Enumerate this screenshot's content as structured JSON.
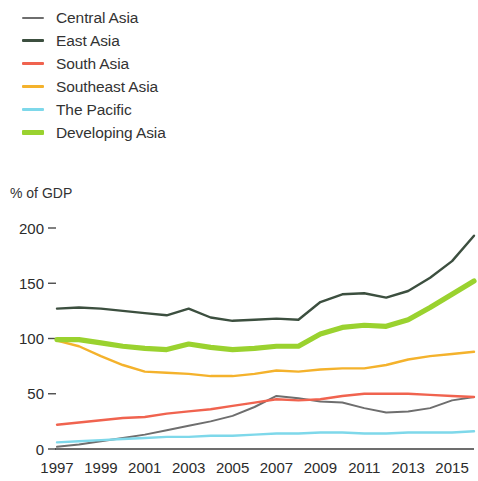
{
  "legend": {
    "items": [
      {
        "label": "Central Asia",
        "color": "#6e6e6e",
        "width": 2.0
      },
      {
        "label": "East Asia",
        "color": "#3c4f3f",
        "width": 2.4
      },
      {
        "label": "South Asia",
        "color": "#f0634f",
        "width": 2.4
      },
      {
        "label": "Southeast Asia",
        "color": "#f4b22c",
        "width": 2.4
      },
      {
        "label": "The Pacific",
        "color": "#7ed8ea",
        "width": 2.4
      },
      {
        "label": "Developing Asia",
        "color": "#9ad22f",
        "width": 5.2
      }
    ]
  },
  "axis_title": "% of GDP",
  "chart_data": {
    "type": "line",
    "title": "",
    "subtitle": "",
    "xlabel": "",
    "ylabel": "% of GDP",
    "ylim": [
      0,
      200
    ],
    "xlim": [
      1997,
      2016
    ],
    "grid": false,
    "legend_position": "top-left",
    "ytick_labels": [
      "0",
      "50",
      "100",
      "150",
      "200"
    ],
    "ytick_values": [
      0,
      50,
      100,
      150,
      200
    ],
    "xtick_labels": [
      "1997",
      "1999",
      "2001",
      "2003",
      "2005",
      "2007",
      "2009",
      "2011",
      "2013",
      "2015"
    ],
    "xtick_values": [
      1997,
      1999,
      2001,
      2003,
      2005,
      2007,
      2009,
      2011,
      2013,
      2015
    ],
    "x": [
      1997,
      1998,
      1999,
      2000,
      2001,
      2002,
      2003,
      2004,
      2005,
      2006,
      2007,
      2008,
      2009,
      2010,
      2011,
      2012,
      2013,
      2014,
      2015,
      2016
    ],
    "series": [
      {
        "name": "Central Asia",
        "color": "#6e6e6e",
        "width": 2.0,
        "values": [
          2,
          4,
          7,
          10,
          13,
          17,
          21,
          25,
          30,
          38,
          48,
          46,
          43,
          42,
          37,
          33,
          34,
          37,
          44,
          47
        ]
      },
      {
        "name": "East Asia",
        "color": "#3c4f3f",
        "width": 2.4,
        "values": [
          127,
          128,
          127,
          125,
          123,
          121,
          127,
          119,
          116,
          117,
          118,
          117,
          133,
          140,
          141,
          137,
          143,
          155,
          170,
          193
        ]
      },
      {
        "name": "South Asia",
        "color": "#f0634f",
        "width": 2.4,
        "values": [
          22,
          24,
          26,
          28,
          29,
          32,
          34,
          36,
          39,
          42,
          45,
          44,
          45,
          48,
          50,
          50,
          50,
          49,
          48,
          47
        ]
      },
      {
        "name": "Southeast Asia",
        "color": "#f4b22c",
        "width": 2.4,
        "values": [
          98,
          93,
          84,
          76,
          70,
          69,
          68,
          66,
          66,
          68,
          71,
          70,
          72,
          73,
          73,
          76,
          81,
          84,
          86,
          88
        ]
      },
      {
        "name": "The Pacific",
        "color": "#7ed8ea",
        "width": 2.4,
        "values": [
          6,
          7,
          8,
          9,
          10,
          11,
          11,
          12,
          12,
          13,
          14,
          14,
          15,
          15,
          14,
          14,
          15,
          15,
          15,
          16
        ]
      },
      {
        "name": "Developing Asia",
        "color": "#9ad22f",
        "width": 5.2,
        "values": [
          99,
          99,
          96,
          93,
          91,
          90,
          95,
          92,
          90,
          91,
          93,
          93,
          104,
          110,
          112,
          111,
          117,
          128,
          140,
          152
        ]
      }
    ]
  }
}
